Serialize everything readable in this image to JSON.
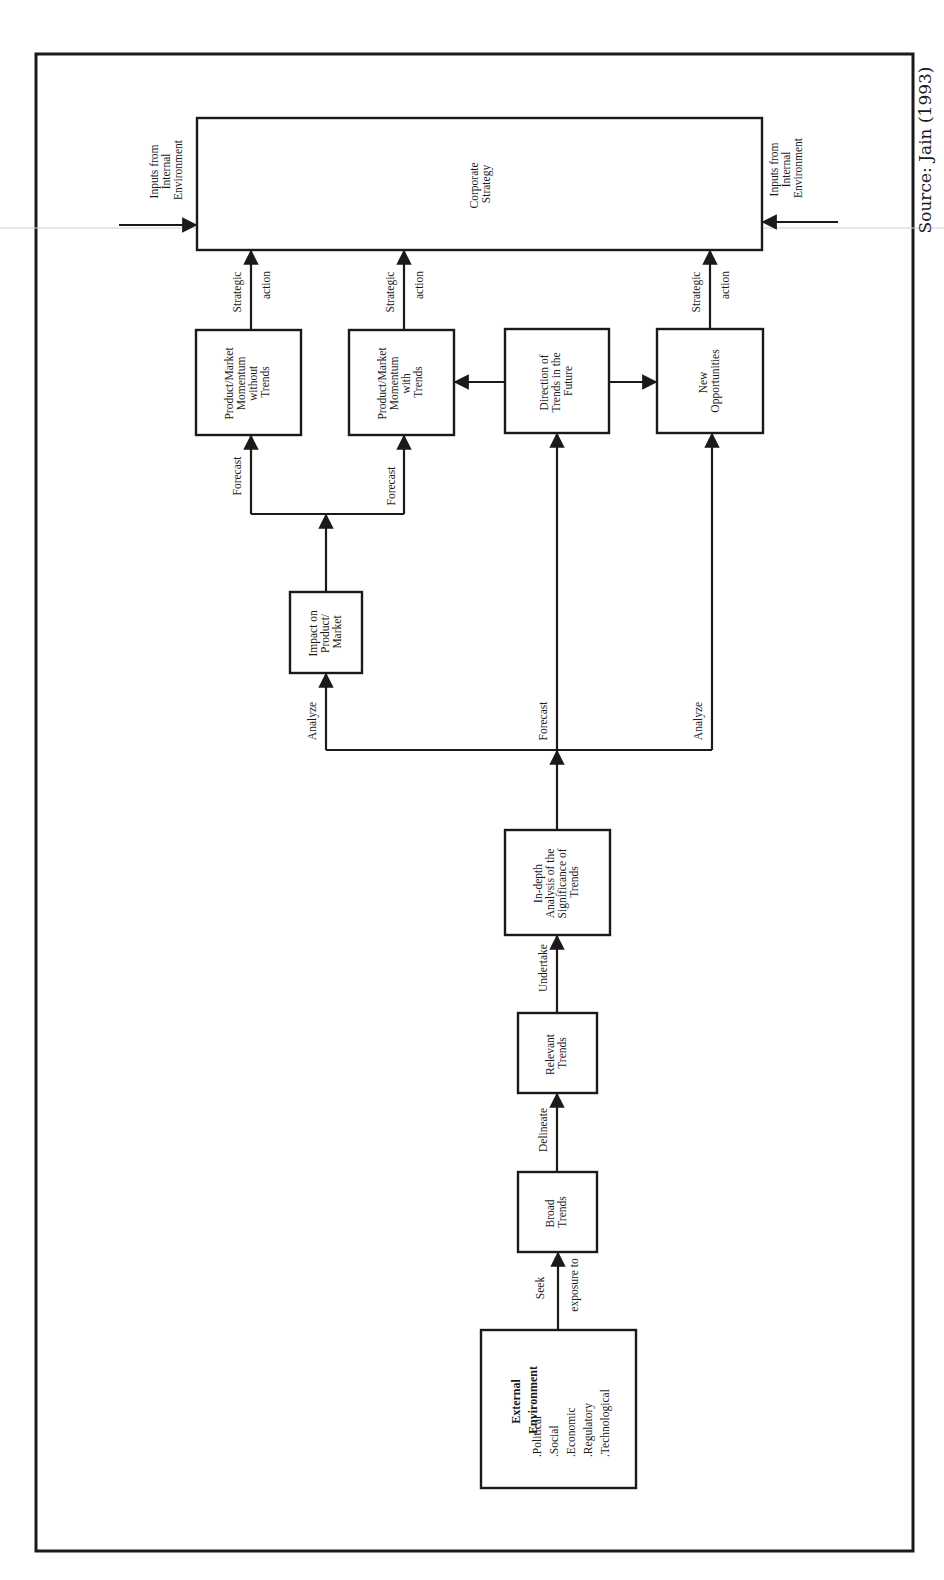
{
  "source": "Source: Jain (1993)",
  "nodes": {
    "corporate_strategy": [
      "Corporate",
      "Strategy"
    ],
    "internal_left": [
      "Inputs from",
      "Internal",
      "Environment"
    ],
    "internal_right": [
      "Inputs from",
      "Internal",
      "Environment"
    ],
    "pm_without": [
      "Product/Market",
      "Momentum",
      "without",
      "Trends"
    ],
    "pm_with": [
      "Product/Market",
      "Momentum",
      "with",
      "Trends"
    ],
    "direction": [
      "Direction of",
      "Trends in the",
      "Future"
    ],
    "new_opps": [
      "New",
      "Opportunities"
    ],
    "impact": [
      "Impact on",
      "Product/",
      "Market"
    ],
    "indepth": [
      "In-depth",
      "Analysis of the",
      "Significance of",
      "Trends"
    ],
    "relevant": [
      "Relevant",
      "Trends"
    ],
    "broad": [
      "Broad",
      "Trends"
    ],
    "external": {
      "title": [
        "External",
        "Environment"
      ],
      "items": [
        ".Political",
        ".Social",
        ".Economic",
        ".Regulatory",
        ".Technological"
      ]
    }
  },
  "edges": {
    "strategic_1": [
      "Strategic",
      "action"
    ],
    "strategic_2": [
      "Strategic",
      "action"
    ],
    "strategic_3": [
      "Strategic",
      "action"
    ],
    "forecast_left": "Forecast",
    "forecast_right": "Forecast",
    "analyze_left": "Analyze",
    "forecast_mid": "Forecast",
    "analyze_right": "Analyze",
    "undertake": "Undertake",
    "delineate": "Delineate",
    "seek": [
      "Seek",
      "exposure to"
    ]
  }
}
